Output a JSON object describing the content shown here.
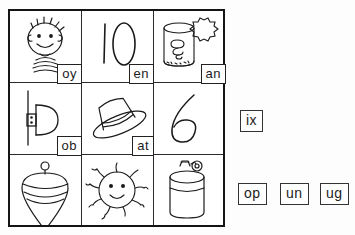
{
  "worksheet": {
    "title": "Phonics picture-word-ending matching worksheet",
    "ink_color": "#1b1b1b",
    "paper_color": "#ffffff"
  },
  "grid": {
    "rows": 3,
    "cols": 3,
    "cells": [
      {
        "id": "cell-1",
        "row": 1,
        "col": 1,
        "picture": "boy-face",
        "picture_label": "boy",
        "ending": "oy",
        "has_ending": true
      },
      {
        "id": "cell-2",
        "row": 1,
        "col": 2,
        "picture": "number-ten",
        "picture_label": "10",
        "ending": "en",
        "has_ending": true
      },
      {
        "id": "cell-3",
        "row": 1,
        "col": 3,
        "picture": "tin-can",
        "picture_label": "can",
        "ending": "an",
        "has_ending": true
      },
      {
        "id": "cell-4",
        "row": 2,
        "col": 1,
        "picture": "door-knob",
        "picture_label": "knob",
        "ending": "ob",
        "has_ending": true
      },
      {
        "id": "cell-5",
        "row": 2,
        "col": 2,
        "picture": "hat",
        "picture_label": "hat",
        "ending": "at",
        "has_ending": true
      },
      {
        "id": "cell-6",
        "row": 2,
        "col": 3,
        "picture": "number-six",
        "picture_label": "6",
        "ending": "",
        "has_ending": false
      },
      {
        "id": "cell-7",
        "row": 3,
        "col": 1,
        "picture": "spinning-top",
        "picture_label": "top",
        "ending": "",
        "has_ending": false
      },
      {
        "id": "cell-8",
        "row": 3,
        "col": 2,
        "picture": "sun",
        "picture_label": "sun",
        "ending": "",
        "has_ending": false
      },
      {
        "id": "cell-9",
        "row": 3,
        "col": 3,
        "picture": "jug",
        "picture_label": "jug",
        "ending": "",
        "has_ending": false
      }
    ],
    "cell_endings": {
      "c1": "oy",
      "c2": "en",
      "c3": "an",
      "c4": "ob",
      "c5": "at"
    }
  },
  "loose_words": {
    "upper": [
      {
        "id": "word-ix",
        "text": "ix"
      }
    ],
    "lower": [
      {
        "id": "word-op",
        "text": "op"
      },
      {
        "id": "word-un",
        "text": "un"
      },
      {
        "id": "word-ug",
        "text": "ug"
      }
    ]
  }
}
